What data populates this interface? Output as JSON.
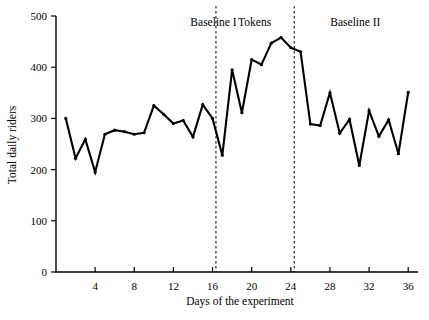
{
  "chart_data": {
    "type": "line",
    "title": "",
    "xlabel": "Days of the experiment",
    "ylabel": "Total daily riders",
    "xlim": [
      0,
      37
    ],
    "ylim": [
      0,
      500
    ],
    "grid": false,
    "legend": null,
    "x_ticks": [
      4,
      8,
      12,
      16,
      20,
      24,
      28,
      32,
      36
    ],
    "x_tick_labels": [
      "4",
      "8",
      "12",
      "16",
      "20",
      "24",
      "28",
      "32",
      "36"
    ],
    "y_ticks": [
      0,
      100,
      200,
      300,
      400,
      500
    ],
    "y_tick_labels": [
      "0",
      "100",
      "200",
      "300",
      "400",
      "500"
    ],
    "series": [
      {
        "name": "Total daily riders",
        "x": [
          1,
          2,
          3,
          4,
          5,
          6,
          7,
          8,
          9,
          10,
          11,
          12,
          13,
          14,
          15,
          16,
          17,
          18,
          19,
          20,
          21,
          22,
          23,
          24,
          25,
          26,
          27,
          28,
          29,
          30,
          31,
          32,
          33,
          34,
          35,
          36
        ],
        "values": [
          300,
          222,
          259,
          195,
          269,
          277,
          274,
          269,
          272,
          325,
          308,
          290,
          296,
          264,
          327,
          300,
          228,
          395,
          311,
          415,
          405,
          447,
          458,
          438,
          430,
          289,
          286,
          350,
          271,
          298,
          208,
          315,
          265,
          297,
          231,
          351
        ]
      }
    ],
    "annotations": [
      {
        "name": "phase-label-baseline-1",
        "text": "Baseline I",
        "x_center": 16.1,
        "y": 480
      },
      {
        "name": "phase-label-tokens",
        "text": "Tokens",
        "x_center": 20.3,
        "y": 480
      },
      {
        "name": "phase-label-baseline-2",
        "text": "Baseline II",
        "x_center": 30.6,
        "y": 480
      }
    ],
    "phase_dividers": [
      {
        "name": "divider-baseline1-tokens",
        "x": 16.35
      },
      {
        "name": "divider-tokens-baseline2",
        "x": 24.35
      }
    ],
    "phases": [
      {
        "label": "Baseline I",
        "start_day": 1,
        "end_day": 16
      },
      {
        "label": "Tokens",
        "start_day": 17,
        "end_day": 24
      },
      {
        "label": "Baseline II",
        "start_day": 25,
        "end_day": 36
      }
    ],
    "colors": {
      "line": "#000000",
      "axis": "#000000",
      "divider": "#000000",
      "background": "#ffffff"
    }
  }
}
